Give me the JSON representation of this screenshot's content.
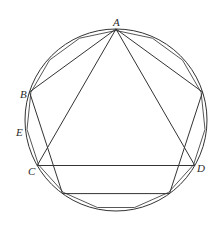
{
  "figure": {
    "type": "geometric-construction",
    "circle": {
      "cx": 116,
      "cy": 120,
      "r": 91
    },
    "stroke_color": "#333333",
    "labels": [
      {
        "id": "A",
        "text": "A",
        "x": 113,
        "y": 17
      },
      {
        "id": "B",
        "text": "B",
        "x": 20,
        "y": 89
      },
      {
        "id": "E",
        "text": "E",
        "x": 16,
        "y": 127
      },
      {
        "id": "C",
        "text": "C",
        "x": 28,
        "y": 166
      },
      {
        "id": "D",
        "text": "D",
        "x": 197,
        "y": 163
      }
    ],
    "points": {
      "A": [
        116,
        29
      ],
      "B": [
        29.5,
        92
      ],
      "P_right": [
        202.5,
        92
      ],
      "P_lower_right": [
        169.5,
        193.6
      ],
      "P_lower_left": [
        62.5,
        193.6
      ],
      "C": [
        37.2,
        165.5
      ],
      "D": [
        194.8,
        165.5
      ]
    },
    "segments": [
      [
        "A",
        "B"
      ],
      [
        "A",
        "P_right"
      ],
      [
        "B",
        "P_lower_left"
      ],
      [
        "P_right",
        "P_lower_right"
      ],
      [
        "P_lower_left",
        "P_lower_right"
      ],
      [
        "A",
        "C"
      ],
      [
        "A",
        "D"
      ],
      [
        "C",
        "D"
      ]
    ],
    "polygon_15_sides": 15
  }
}
